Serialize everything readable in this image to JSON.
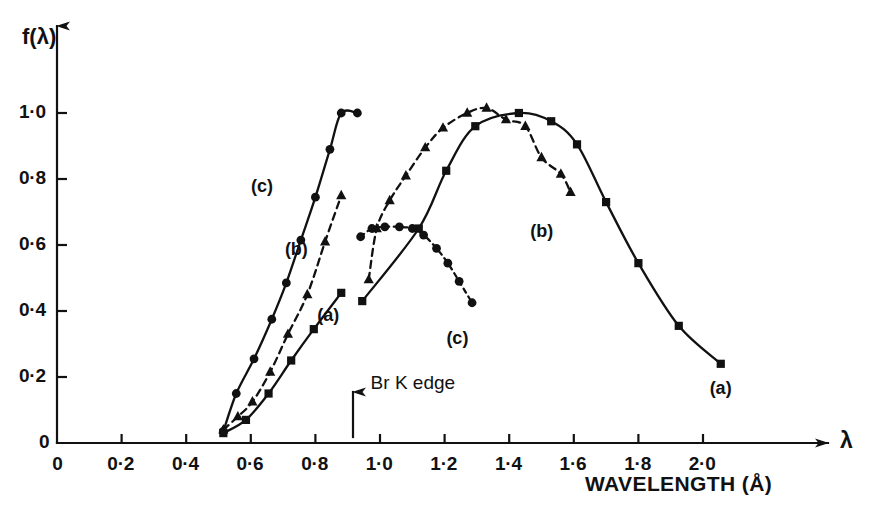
{
  "chart_data": {
    "type": "line",
    "title": "",
    "subtitle": "",
    "xlabel": "WAVELENGTH (Å)",
    "ylabel": "f(λ)",
    "x_axis_symbol": "λ",
    "xlim": [
      0,
      2.25
    ],
    "ylim": [
      0,
      1.1
    ],
    "grid": false,
    "legend_position": "inline-curve-labels",
    "x_ticks": [
      0,
      0.2,
      0.4,
      0.6,
      0.8,
      1.0,
      1.2,
      1.4,
      1.6,
      1.8,
      2.0
    ],
    "x_tick_labels": [
      "0",
      "0·2",
      "0·4",
      "0·6",
      "0·8",
      "1·0",
      "1·2",
      "1·4",
      "1·6",
      "1·8",
      "2·0"
    ],
    "y_ticks": [
      0,
      0.2,
      0.4,
      0.6,
      0.8,
      1.0
    ],
    "y_tick_labels": [
      "0",
      "0·2",
      "0·4",
      "0·6",
      "0·8",
      "1·0"
    ],
    "annotations": [
      {
        "name": "br-k-edge",
        "text": "Br K edge",
        "x": 0.94,
        "y": 0.1,
        "marker": "up-arrow"
      }
    ],
    "series": [
      {
        "name": "(a) pre-edge branch",
        "label": "(a)",
        "label_x": 0.845,
        "label_y": 0.385,
        "marker": "square",
        "line_style": "solid",
        "points": [
          [
            0.515,
            0.03
          ],
          [
            0.585,
            0.07
          ],
          [
            0.655,
            0.15
          ],
          [
            0.725,
            0.25
          ],
          [
            0.795,
            0.345
          ],
          [
            0.88,
            0.455
          ]
        ]
      },
      {
        "name": "(b) pre-edge branch",
        "label": "(b)",
        "label_x": 0.745,
        "label_y": 0.585,
        "marker": "triangle",
        "line_style": "dashed",
        "points": [
          [
            0.515,
            0.04
          ],
          [
            0.56,
            0.08
          ],
          [
            0.605,
            0.125
          ],
          [
            0.66,
            0.215
          ],
          [
            0.715,
            0.33
          ],
          [
            0.775,
            0.45
          ],
          [
            0.83,
            0.61
          ],
          [
            0.88,
            0.75
          ]
        ]
      },
      {
        "name": "(c) pre-edge branch",
        "label": "(c)",
        "label_x": 0.64,
        "label_y": 0.775,
        "marker": "circle",
        "line_style": "solid",
        "points": [
          [
            0.515,
            0.035
          ],
          [
            0.555,
            0.15
          ],
          [
            0.61,
            0.255
          ],
          [
            0.665,
            0.375
          ],
          [
            0.71,
            0.485
          ],
          [
            0.755,
            0.615
          ],
          [
            0.8,
            0.745
          ],
          [
            0.845,
            0.89
          ],
          [
            0.88,
            1.0
          ],
          [
            0.93,
            1.0
          ]
        ]
      },
      {
        "name": "(a) post-edge branch",
        "label": "(a)",
        "label_x": 2.06,
        "label_y": 0.165,
        "marker": "square",
        "line_style": "solid",
        "points": [
          [
            0.945,
            0.43
          ],
          [
            1.12,
            0.65
          ],
          [
            1.205,
            0.825
          ],
          [
            1.295,
            0.96
          ],
          [
            1.43,
            1.0
          ],
          [
            1.53,
            0.975
          ],
          [
            1.61,
            0.905
          ],
          [
            1.7,
            0.73
          ],
          [
            1.8,
            0.545
          ],
          [
            1.925,
            0.355
          ],
          [
            2.055,
            0.24
          ]
        ]
      },
      {
        "name": "(b) post-edge branch",
        "label": "(b)",
        "label_x": 1.505,
        "label_y": 0.64,
        "marker": "triangle",
        "line_style": "dashed",
        "points": [
          [
            0.965,
            0.495
          ],
          [
            0.99,
            0.65
          ],
          [
            1.03,
            0.735
          ],
          [
            1.08,
            0.81
          ],
          [
            1.14,
            0.895
          ],
          [
            1.195,
            0.955
          ],
          [
            1.27,
            1.0
          ],
          [
            1.33,
            1.015
          ],
          [
            1.39,
            0.98
          ],
          [
            1.45,
            0.96
          ],
          [
            1.5,
            0.865
          ],
          [
            1.56,
            0.815
          ],
          [
            1.59,
            0.76
          ]
        ]
      },
      {
        "name": "(c) post-edge branch",
        "label": "(c)",
        "label_x": 1.245,
        "label_y": 0.315,
        "marker": "circle",
        "line_style": "dotted",
        "points": [
          [
            0.94,
            0.625
          ],
          [
            0.975,
            0.65
          ],
          [
            1.015,
            0.655
          ],
          [
            1.06,
            0.655
          ],
          [
            1.1,
            0.65
          ],
          [
            1.135,
            0.63
          ],
          [
            1.175,
            0.59
          ],
          [
            1.21,
            0.545
          ],
          [
            1.245,
            0.49
          ],
          [
            1.285,
            0.425
          ]
        ]
      }
    ]
  },
  "axes": {
    "y_axis_title": "f(λ)",
    "x_axis_title": "WAVELENGTH (Å)",
    "x_axis_symbol": "λ"
  },
  "colors": {
    "ink": "#111111",
    "background": "#ffffff"
  }
}
